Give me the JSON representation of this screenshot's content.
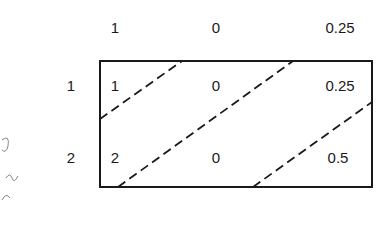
{
  "column_headers": [
    "1",
    "0",
    "0.25"
  ],
  "row_headers": [
    "1",
    "2"
  ],
  "cells": [
    [
      "1",
      "0",
      "0.25"
    ],
    [
      "2",
      "0",
      "0.5"
    ]
  ],
  "colors": {
    "line": "#1a1a1a",
    "background": "#ffffff"
  }
}
